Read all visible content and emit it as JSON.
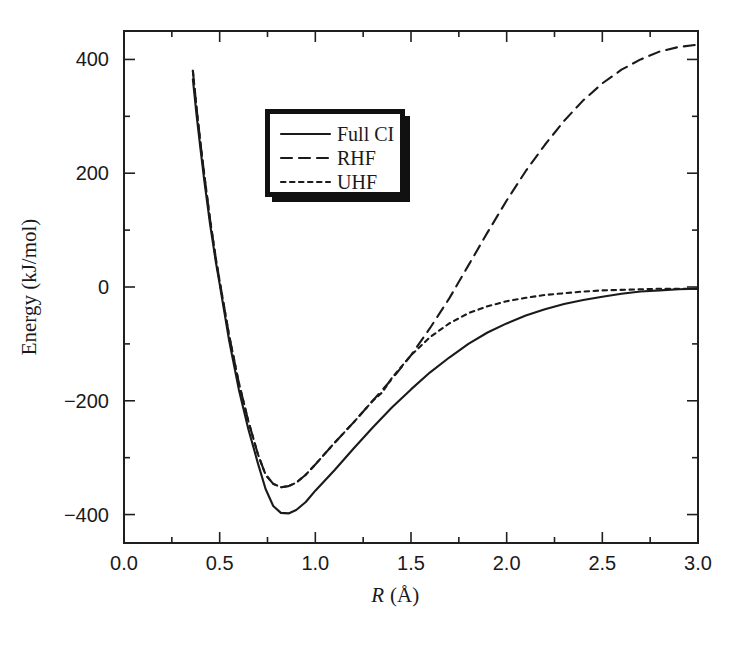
{
  "chart_data": {
    "type": "line",
    "title": "",
    "xlabel": "R (Å)",
    "xlabel_italic_part": "R",
    "xlabel_unit_part": "(Å)",
    "ylabel": "Energy (kJ/mol)",
    "xlim": [
      0.0,
      3.0
    ],
    "ylim": [
      -450,
      450
    ],
    "grid": false,
    "legend_position": "upper-left-inside",
    "xticks": [
      "0.0",
      "0.5",
      "1.0",
      "1.5",
      "2.0",
      "2.5",
      "3.0"
    ],
    "xtick_values": [
      0.0,
      0.5,
      1.0,
      1.5,
      2.0,
      2.5,
      3.0
    ],
    "xminor_step": 0.25,
    "yticks": [
      "400",
      "200",
      "0",
      "−200",
      "−400"
    ],
    "ytick_values": [
      400,
      200,
      0,
      -200,
      -400
    ],
    "yminor_step": 100,
    "series": [
      {
        "name": "Full CI",
        "style": "solid",
        "x": [
          0.36,
          0.38,
          0.4,
          0.42,
          0.45,
          0.48,
          0.5,
          0.55,
          0.6,
          0.65,
          0.7,
          0.74,
          0.78,
          0.82,
          0.86,
          0.9,
          0.95,
          1.0,
          1.1,
          1.2,
          1.3,
          1.4,
          1.5,
          1.6,
          1.7,
          1.8,
          1.9,
          2.0,
          2.1,
          2.2,
          2.3,
          2.4,
          2.5,
          2.6,
          2.7,
          2.8,
          2.9,
          3.0
        ],
        "y": [
          365,
          300,
          242,
          186,
          110,
          44,
          5,
          -95,
          -180,
          -250,
          -310,
          -355,
          -385,
          -397,
          -398,
          -392,
          -378,
          -358,
          -322,
          -284,
          -247,
          -212,
          -180,
          -150,
          -124,
          -100,
          -80,
          -64,
          -50,
          -39,
          -30,
          -23,
          -17,
          -12,
          -8,
          -6,
          -4,
          -3
        ]
      },
      {
        "name": "RHF",
        "style": "dashed",
        "x": [
          0.36,
          0.38,
          0.4,
          0.42,
          0.45,
          0.48,
          0.5,
          0.55,
          0.6,
          0.65,
          0.7,
          0.74,
          0.78,
          0.82,
          0.86,
          0.9,
          0.95,
          1.0,
          1.1,
          1.2,
          1.3,
          1.4,
          1.5,
          1.6,
          1.7,
          1.8,
          1.9,
          2.0,
          2.1,
          2.2,
          2.3,
          2.4,
          2.5,
          2.6,
          2.7,
          2.8,
          2.9,
          3.0
        ],
        "y": [
          380,
          312,
          252,
          196,
          118,
          50,
          10,
          -86,
          -168,
          -236,
          -294,
          -330,
          -346,
          -352,
          -350,
          -344,
          -330,
          -312,
          -274,
          -238,
          -200,
          -162,
          -120,
          -72,
          -20,
          38,
          96,
          152,
          204,
          250,
          292,
          328,
          358,
          382,
          400,
          414,
          422,
          426
        ]
      },
      {
        "name": "UHF",
        "style": "dotted",
        "x": [
          0.36,
          0.38,
          0.4,
          0.42,
          0.45,
          0.48,
          0.5,
          0.55,
          0.6,
          0.65,
          0.7,
          0.74,
          0.78,
          0.82,
          0.86,
          0.9,
          0.95,
          1.0,
          1.1,
          1.2,
          1.3,
          1.35,
          1.4,
          1.5,
          1.6,
          1.7,
          1.8,
          1.9,
          2.0,
          2.1,
          2.2,
          2.3,
          2.4,
          2.5,
          2.6,
          2.7,
          2.8,
          2.9,
          3.0
        ],
        "y": [
          380,
          312,
          252,
          196,
          118,
          50,
          10,
          -86,
          -168,
          -236,
          -294,
          -330,
          -346,
          -352,
          -350,
          -344,
          -330,
          -312,
          -274,
          -238,
          -200,
          -185,
          -160,
          -120,
          -88,
          -64,
          -46,
          -34,
          -25,
          -19,
          -14,
          -11,
          -8,
          -6,
          -5,
          -4,
          -3,
          -3,
          -3
        ]
      }
    ]
  },
  "legend": {
    "items": [
      {
        "label": "Full CI",
        "style": "solid"
      },
      {
        "label": "RHF",
        "style": "dashed"
      },
      {
        "label": "UHF",
        "style": "dotted"
      }
    ]
  },
  "colors": {
    "axis": "#1f1f1f",
    "curve": "#1a1a1a",
    "legend_border": "#111111",
    "background": "#ffffff"
  }
}
